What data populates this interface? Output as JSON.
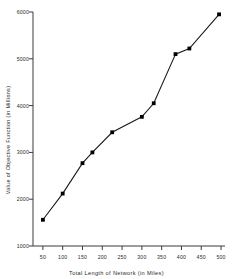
{
  "chart_data": {
    "type": "line",
    "title": "",
    "xlabel": "Total Length of Network (in Miles)",
    "ylabel": "Value of Objective Function (in Millions)",
    "xlim": [
      25,
      510
    ],
    "ylim": [
      1000,
      6000
    ],
    "xticks": [
      50,
      100,
      150,
      200,
      250,
      300,
      350,
      400,
      450,
      500
    ],
    "yticks": [
      1000,
      2000,
      3000,
      4000,
      5000,
      6000
    ],
    "grid": false,
    "legend": null,
    "marker": "square",
    "line_color": "#1a1a1a",
    "marker_color": "#000000",
    "x": [
      50,
      100,
      150,
      175,
      225,
      300,
      330,
      385,
      420,
      495
    ],
    "values": [
      1560,
      2120,
      2770,
      3000,
      3430,
      3760,
      4050,
      5100,
      5220,
      5950
    ],
    "series": [
      {
        "name": "Objective value",
        "points": [
          {
            "x": 50,
            "y": 1560
          },
          {
            "x": 100,
            "y": 2120
          },
          {
            "x": 150,
            "y": 2770
          },
          {
            "x": 175,
            "y": 3000
          },
          {
            "x": 225,
            "y": 3430
          },
          {
            "x": 300,
            "y": 3760
          },
          {
            "x": 330,
            "y": 4050
          },
          {
            "x": 385,
            "y": 5100
          },
          {
            "x": 420,
            "y": 5220
          },
          {
            "x": 495,
            "y": 5950
          }
        ]
      }
    ]
  }
}
